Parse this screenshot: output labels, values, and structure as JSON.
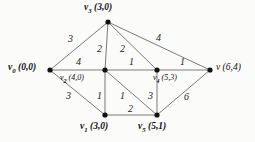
{
  "figure": {
    "type": "weighted-graph-diagram",
    "background_color": "#fbfbf9",
    "edge_color": "#6b6b6b",
    "node_color": "#111111",
    "text_color": "#111111"
  },
  "vertices": [
    {
      "id": "v0",
      "name": "v",
      "subscript": "0",
      "coord": "(0,0)",
      "label": "v0 (0,0)",
      "x": 50,
      "y": 70,
      "label_x": 8,
      "label_y": 63,
      "style": "bold"
    },
    {
      "id": "v3",
      "name": "v",
      "subscript": "3",
      "coord": "(3,0)",
      "label": "v3 (3,0)",
      "x": 108,
      "y": 22,
      "label_x": 84,
      "label_y": 3,
      "style": "bold"
    },
    {
      "id": "v2",
      "name": "v",
      "subscript": "2",
      "coord": "(4,0)",
      "label": "v2 (4,0)",
      "x": 105,
      "y": 70,
      "label_x": 60,
      "label_y": 74,
      "style": "small"
    },
    {
      "id": "v4",
      "name": "v",
      "subscript": "4",
      "coord": "(5,3)",
      "label": "v4 (5,3)",
      "x": 157,
      "y": 70,
      "label_x": 153,
      "label_y": 74,
      "style": "small"
    },
    {
      "id": "v",
      "name": "v",
      "subscript": "",
      "coord": "(6,4)",
      "label": "v (6,4)",
      "x": 210,
      "y": 70,
      "label_x": 216,
      "label_y": 63,
      "style": "plain"
    },
    {
      "id": "v1",
      "name": "v",
      "subscript": "1",
      "coord": "(3,0)",
      "label": "v1 (3,0)",
      "x": 105,
      "y": 115,
      "label_x": 80,
      "label_y": 122,
      "style": "bold"
    },
    {
      "id": "v5",
      "name": "v",
      "subscript": "5",
      "coord": "(5,1)",
      "label": "v5 (5,1)",
      "x": 157,
      "y": 115,
      "label_x": 138,
      "label_y": 122,
      "style": "bold"
    }
  ],
  "edges": [
    {
      "id": "e-v0-v3",
      "from": "v0",
      "to": "v3",
      "weight": "3",
      "label_x": 68,
      "label_y": 34
    },
    {
      "id": "e-v0-v2",
      "from": "v0",
      "to": "v2",
      "weight": "4",
      "label_x": 76,
      "label_y": 57
    },
    {
      "id": "e-v0-v1",
      "from": "v0",
      "to": "v1",
      "weight": "3",
      "label_x": 66,
      "label_y": 91
    },
    {
      "id": "e-v3-v2",
      "from": "v3",
      "to": "v2",
      "weight": "2",
      "label_x": 97,
      "label_y": 44
    },
    {
      "id": "e-v3-v4",
      "from": "v3",
      "to": "v4",
      "weight": "2",
      "label_x": 120,
      "label_y": 44
    },
    {
      "id": "e-v3-v",
      "from": "v3",
      "to": "v",
      "weight": "4",
      "label_x": 156,
      "label_y": 33
    },
    {
      "id": "e-v2-v4",
      "from": "v2",
      "to": "v4",
      "weight": "1",
      "label_x": 129,
      "label_y": 57
    },
    {
      "id": "e-v4-v",
      "from": "v4",
      "to": "v",
      "weight": "1",
      "label_x": 180,
      "label_y": 57
    },
    {
      "id": "e-v2-v1",
      "from": "v2",
      "to": "v1",
      "weight": "1",
      "label_x": 97,
      "label_y": 91
    },
    {
      "id": "e-v2-v5",
      "from": "v2",
      "to": "v5",
      "weight": "1",
      "label_x": 120,
      "label_y": 91
    },
    {
      "id": "e-v4-v5",
      "from": "v4",
      "to": "v5",
      "weight": "3",
      "label_x": 148,
      "label_y": 91
    },
    {
      "id": "e-v1-v5",
      "from": "v1",
      "to": "v5",
      "weight": "2",
      "label_x": 128,
      "label_y": 104
    },
    {
      "id": "e-v5-v",
      "from": "v5",
      "to": "v",
      "weight": "6",
      "label_x": 184,
      "label_y": 92
    }
  ]
}
